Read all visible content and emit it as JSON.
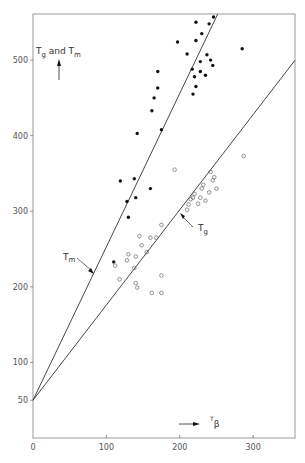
{
  "chart_data": {
    "type": "scatter",
    "title": "",
    "xlabel": "Tβ",
    "ylabel": "Tg and Tm",
    "xlim": [
      0,
      357
    ],
    "ylim": [
      0,
      561
    ],
    "grid": false,
    "x_ticks": [
      {
        "value": 0,
        "label": "0"
      },
      {
        "value": 100,
        "label": "100"
      },
      {
        "value": 200,
        "label": "200"
      },
      {
        "value": 300,
        "label": "300"
      }
    ],
    "y_ticks": [
      {
        "value": 50,
        "label": "50"
      },
      {
        "value": 100,
        "label": "100"
      },
      {
        "value": 200,
        "label": "200"
      },
      {
        "value": 300,
        "label": "300"
      },
      {
        "value": 400,
        "label": "400"
      },
      {
        "value": 500,
        "label": "500"
      }
    ],
    "series": [
      {
        "name": "Tm",
        "marker": "filled-circle",
        "points": [
          [
            110,
            233
          ],
          [
            119,
            340
          ],
          [
            128,
            313
          ],
          [
            130,
            292
          ],
          [
            138,
            343
          ],
          [
            140,
            318
          ],
          [
            142,
            403
          ],
          [
            160,
            330
          ],
          [
            162,
            433
          ],
          [
            165,
            450
          ],
          [
            170,
            463
          ],
          [
            170,
            485
          ],
          [
            175,
            408
          ],
          [
            197,
            524
          ],
          [
            210,
            508
          ],
          [
            217,
            488
          ],
          [
            218,
            455
          ],
          [
            220,
            478
          ],
          [
            222,
            465
          ],
          [
            222,
            526
          ],
          [
            222,
            550
          ],
          [
            228,
            485
          ],
          [
            228,
            498
          ],
          [
            230,
            535
          ],
          [
            235,
            480
          ],
          [
            237,
            507
          ],
          [
            240,
            548
          ],
          [
            242,
            500
          ],
          [
            245,
            493
          ],
          [
            246,
            557
          ],
          [
            285,
            515
          ]
        ]
      },
      {
        "name": "Tg",
        "marker": "open-circle",
        "points": [
          [
            112,
            228
          ],
          [
            118,
            210
          ],
          [
            128,
            235
          ],
          [
            130,
            243
          ],
          [
            138,
            225
          ],
          [
            140,
            240
          ],
          [
            140,
            205
          ],
          [
            142,
            199
          ],
          [
            145,
            267
          ],
          [
            148,
            255
          ],
          [
            155,
            246
          ],
          [
            160,
            265
          ],
          [
            162,
            192
          ],
          [
            168,
            265
          ],
          [
            175,
            282
          ],
          [
            175,
            215
          ],
          [
            175,
            192
          ],
          [
            193,
            355
          ],
          [
            210,
            302
          ],
          [
            212,
            309
          ],
          [
            215,
            316
          ],
          [
            218,
            318
          ],
          [
            220,
            323
          ],
          [
            225,
            310
          ],
          [
            228,
            318
          ],
          [
            230,
            330
          ],
          [
            232,
            335
          ],
          [
            235,
            314
          ],
          [
            240,
            325
          ],
          [
            242,
            352
          ],
          [
            245,
            341
          ],
          [
            247,
            345
          ],
          [
            250,
            330
          ],
          [
            287,
            373
          ]
        ]
      }
    ],
    "lines": [
      {
        "name": "Tm",
        "label": "Tm",
        "x0": 0,
        "y0": 50,
        "slope": 2.03
      },
      {
        "name": "Tg",
        "label": "Tg",
        "x0": 0,
        "y0": 50,
        "slope": 1.26
      }
    ],
    "annotations": [
      {
        "text": "Tm",
        "points_to": "Tm line"
      },
      {
        "text": "Tg",
        "points_to": "Tg line"
      },
      {
        "text": "Tg and Tm",
        "arrow": "up"
      },
      {
        "text": "Tβ",
        "arrow": "right"
      }
    ]
  },
  "labels": {
    "y_axis": {
      "main": "T",
      "sub1": "g",
      "mid": " and T",
      "sub2": "m"
    },
    "x_axis": {
      "main": "T",
      "sub": "β"
    },
    "tm_line": {
      "main": "T",
      "sub": "m"
    },
    "tg_line": {
      "main": "T",
      "sub": "g"
    }
  }
}
